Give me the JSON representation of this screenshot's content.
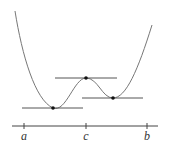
{
  "diagram": {
    "type": "function-graph-with-horizontal-tangents",
    "colors": {
      "curve": "#777777",
      "tangent": "#555555",
      "axis": "#444444",
      "point": "#111111",
      "label": "#333333"
    },
    "axis": {
      "y": 126,
      "x_start": 12,
      "x_end": 158,
      "ticks": [
        {
          "x": 24,
          "label": "a"
        },
        {
          "x": 86,
          "label": "c"
        },
        {
          "x": 147,
          "label": "b"
        }
      ]
    },
    "critical_points": [
      {
        "name": "left-minimum",
        "x": 53,
        "y": 108
      },
      {
        "name": "local-maximum",
        "x": 86,
        "y": 78
      },
      {
        "name": "right-minimum",
        "x": 113,
        "y": 98
      }
    ],
    "tangent_lines": [
      {
        "name": "tangent-left-minimum",
        "x1": 22,
        "x2": 83,
        "y": 108
      },
      {
        "name": "tangent-local-maximum",
        "x1": 55,
        "x2": 117,
        "y": 78
      },
      {
        "name": "tangent-right-minimum",
        "x1": 82,
        "x2": 143,
        "y": 98
      }
    ]
  }
}
